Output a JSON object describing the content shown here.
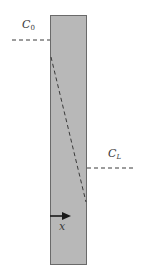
{
  "diagram": {
    "type": "concentration-profile-across-membrane",
    "slab": {
      "fill": "#b8b8b8",
      "stroke": "#6a6a6a"
    },
    "labels": {
      "c0": {
        "main": "C",
        "sub": "0"
      },
      "cl": {
        "main": "C",
        "sub": "L"
      },
      "x_axis": "x"
    },
    "colors": {
      "dash_line": "#3a3a3a",
      "arrow": "#1a1a1a",
      "text": "#3a3a3a"
    }
  }
}
